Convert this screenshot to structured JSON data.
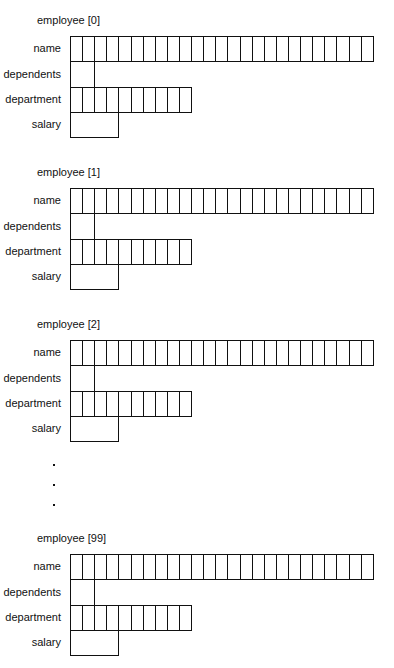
{
  "diagram": {
    "fields": [
      "name",
      "dependents",
      "department",
      "salary"
    ],
    "cell_counts": {
      "name": 25,
      "dependents": 2,
      "department": 10,
      "salary": 4
    },
    "records": [
      {
        "label": "employee [0]",
        "top": 14
      },
      {
        "label": "employee [1]",
        "top": 166
      },
      {
        "label": "employee [2]",
        "top": 318
      },
      {
        "label": "employee [99]",
        "top": 532
      }
    ],
    "ellipsis": [
      {
        "top": 464
      },
      {
        "top": 484
      },
      {
        "top": 504
      }
    ],
    "line_color": "#111111"
  }
}
